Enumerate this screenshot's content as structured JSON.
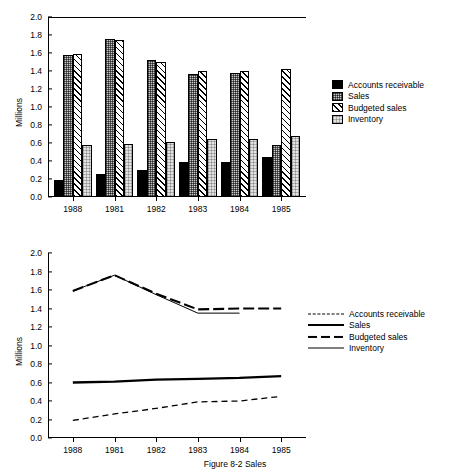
{
  "figure": {
    "caption": "Figure 8-2  Sales"
  },
  "chart_data": [
    {
      "type": "bar",
      "title": "",
      "xlabel": "",
      "ylabel": "Millions",
      "categories": [
        "1988",
        "1981",
        "1982",
        "1983",
        "1984",
        "1985"
      ],
      "ylim": [
        0.0,
        2.0
      ],
      "yticks": [
        "0.0",
        "0.2",
        "0.4",
        "0.6",
        "0.8",
        "1.0",
        "1.2",
        "1.4",
        "1.6",
        "1.8",
        "2.0"
      ],
      "grid": false,
      "legend_position": "right",
      "series": [
        {
          "name": "Accounts receivable",
          "fill": "solid",
          "values": [
            0.19,
            0.26,
            0.3,
            0.39,
            0.39,
            0.45
          ]
        },
        {
          "name": "Sales",
          "fill": "checker",
          "values": [
            1.58,
            1.76,
            1.52,
            1.37,
            1.38,
            0.58
          ]
        },
        {
          "name": "Budgeted sales",
          "fill": "hatch",
          "values": [
            1.59,
            1.74,
            1.5,
            1.4,
            1.4,
            1.42
          ]
        },
        {
          "name": "Inventory",
          "fill": "light",
          "values": [
            0.58,
            0.59,
            0.61,
            0.64,
            0.64,
            0.68
          ]
        }
      ]
    },
    {
      "type": "line",
      "title": "",
      "xlabel": "",
      "ylabel": "Millions",
      "categories": [
        "1988",
        "1981",
        "1982",
        "1983",
        "1984",
        "1985"
      ],
      "ylim": [
        0.0,
        2.0
      ],
      "yticks": [
        "0.0",
        "0.2",
        "0.4",
        "0.6",
        "0.8",
        "1.0",
        "1.2",
        "1.4",
        "1.6",
        "1.8",
        "2.0"
      ],
      "grid": false,
      "legend_position": "right",
      "series": [
        {
          "name": "Accounts receivable",
          "style": "dash-short",
          "values": [
            0.19,
            0.26,
            0.32,
            0.39,
            0.4,
            0.45
          ]
        },
        {
          "name": "Sales",
          "style": "solid-thick",
          "values": [
            0.6,
            0.61,
            0.63,
            0.64,
            0.65,
            0.67
          ]
        },
        {
          "name": "Budgeted sales",
          "style": "dash-long",
          "values": [
            1.59,
            1.76,
            1.56,
            1.39,
            1.4,
            1.4
          ]
        },
        {
          "name": "Inventory",
          "style": "solid-thin",
          "values": [
            1.59,
            1.76,
            1.55,
            1.35,
            1.35,
            null
          ]
        }
      ]
    }
  ],
  "bar_chart": {
    "ylabel": "Millions",
    "legend": {
      "items": [
        {
          "label": "Accounts receivable",
          "fill": "solid"
        },
        {
          "label": "Sales",
          "fill": "checker"
        },
        {
          "label": "Budgeted sales",
          "fill": "hatch"
        },
        {
          "label": "Inventory",
          "fill": "light"
        }
      ]
    }
  },
  "line_chart": {
    "ylabel": "Millions",
    "legend": {
      "items": [
        {
          "label": "Accounts receivable",
          "style": "dash-short"
        },
        {
          "label": "Sales",
          "style": "solid-thick"
        },
        {
          "label": "Budgeted sales",
          "style": "dash-long"
        },
        {
          "label": "Inventory",
          "style": "solid-thin"
        }
      ]
    }
  }
}
